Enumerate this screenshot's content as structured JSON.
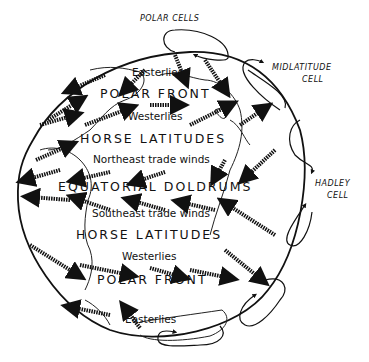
{
  "diagram": {
    "cell_labels": {
      "polar": "POLAR CELLS",
      "midlatitude_line1": "MIDLATITUDE",
      "midlatitude_line2": "CELL",
      "hadley_line1": "HADLEY",
      "hadley_line2": "CELL"
    },
    "zones": {
      "north_easterlies": "Easterlies",
      "north_polar_front": "POLAR FRONT",
      "north_westerlies": "Westerlies",
      "north_horse_latitudes": "HORSE LATITUDES",
      "northeast_trades": "Northeast trade winds",
      "equatorial_doldrums": "EQUATORIAL DOLDRUMS",
      "southeast_trades": "Southeast trade winds",
      "south_horse_latitudes": "HORSE LATITUDES",
      "south_westerlies": "Westerlies",
      "south_polar_front": "POLAR FRONT",
      "south_easterlies": "Easterlies"
    },
    "colors": {
      "ink": "#111111",
      "background": "#ffffff"
    }
  }
}
